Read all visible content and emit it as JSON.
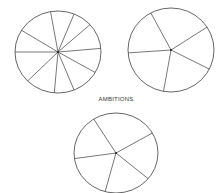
{
  "title": "AMBITIONS",
  "colors": {
    "stroke": "#555555",
    "background": "#ffffff"
  },
  "circles": [
    {
      "name": "circle-ten-segments",
      "cx": 58,
      "cy": 52,
      "rx": 43,
      "ry": 41,
      "spoke_angles_deg": [
        -100,
        -68,
        -42,
        -5,
        30,
        68,
        95,
        135,
        180,
        -148
      ],
      "segments": 10
    },
    {
      "name": "circle-five-segments-top",
      "cx": 171,
      "cy": 50,
      "rx": 43,
      "ry": 42,
      "spoke_angles_deg": [
        -118,
        -33,
        27,
        100,
        176
      ],
      "segments": 5
    },
    {
      "name": "circle-five-segments-ambitions",
      "cx": 116,
      "cy": 153,
      "rx": 42,
      "ry": 40,
      "spoke_angles_deg": [
        -122,
        -30,
        40,
        105,
        172
      ],
      "segments": 5
    }
  ]
}
